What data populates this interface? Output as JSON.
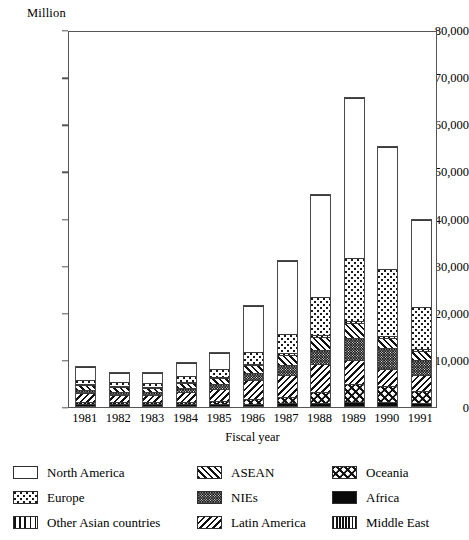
{
  "chart_data": {
    "type": "bar",
    "stacked": true,
    "title": "",
    "unit_label": "Million",
    "xlabel": "Fiscal year",
    "ylabel": "",
    "ylim": [
      0,
      80000
    ],
    "ytick_step": 10000,
    "grid": false,
    "legend_position": "bottom",
    "categories": [
      "1981",
      "1982",
      "1983",
      "1984",
      "1985",
      "1986",
      "1987",
      "1988",
      "1989",
      "1990",
      "1991"
    ],
    "ytick_labels": [
      "0",
      "10,000",
      "20,000",
      "30,000",
      "40,000",
      "50,000",
      "60,000",
      "70,000",
      "80,000"
    ],
    "ytick_values": [
      0,
      10000,
      20000,
      30000,
      40000,
      50000,
      60000,
      70000,
      80000
    ],
    "series": [
      {
        "name": "Africa",
        "pattern": "africa",
        "values": [
          300,
          250,
          250,
          250,
          250,
          300,
          350,
          450,
          600,
          600,
          500
        ]
      },
      {
        "name": "Middle East",
        "pattern": "mideast",
        "values": [
          150,
          120,
          120,
          120,
          120,
          150,
          200,
          250,
          300,
          300,
          250
        ]
      },
      {
        "name": "Oceania",
        "pattern": "oceania",
        "values": [
          450,
          430,
          430,
          530,
          680,
          1050,
          1400,
          2300,
          3700,
          3400,
          2500
        ]
      },
      {
        "name": "Latin America",
        "pattern": "latin",
        "values": [
          1900,
          1700,
          1600,
          2200,
          2600,
          4000,
          4700,
          6000,
          5200,
          3600,
          3300
        ]
      },
      {
        "name": "NIEs",
        "pattern": "nies",
        "values": [
          800,
          700,
          700,
          900,
          1100,
          1600,
          2200,
          3100,
          4700,
          4400,
          3400
        ]
      },
      {
        "name": "ASEAN",
        "pattern": "asean",
        "values": [
          1100,
          1000,
          1000,
          1200,
          1400,
          1800,
          2200,
          2700,
          3200,
          2200,
          1900
        ]
      },
      {
        "name": "Other Asian countries",
        "pattern": "otherasia",
        "values": [
          150,
          130,
          130,
          150,
          180,
          250,
          300,
          400,
          500,
          500,
          450
        ]
      },
      {
        "name": "Europe",
        "pattern": "europe",
        "values": [
          1000,
          900,
          900,
          1200,
          1700,
          2500,
          4200,
          8200,
          13500,
          14200,
          9000
        ]
      },
      {
        "name": "North America",
        "pattern": "north",
        "values": [
          2800,
          2300,
          2400,
          3000,
          3600,
          9900,
          15600,
          21900,
          34000,
          26200,
          18600
        ]
      }
    ],
    "totals": [
      8650,
      7530,
      7530,
      9550,
      11630,
      21550,
      31150,
      45300,
      65700,
      55400,
      39900
    ]
  },
  "legend": {
    "columns": [
      [
        {
          "label": "North America",
          "pattern": "north"
        },
        {
          "label": "Europe",
          "pattern": "europe"
        },
        {
          "label": "Other Asian countries",
          "pattern": "otherasia"
        }
      ],
      [
        {
          "label": "ASEAN",
          "pattern": "asean"
        },
        {
          "label": "NIEs",
          "pattern": "nies"
        },
        {
          "label": "Latin America",
          "pattern": "latin"
        }
      ],
      [
        {
          "label": "Oceania",
          "pattern": "oceania"
        },
        {
          "label": "Africa",
          "pattern": "africa"
        },
        {
          "label": "Middle East",
          "pattern": "mideast"
        }
      ]
    ]
  }
}
